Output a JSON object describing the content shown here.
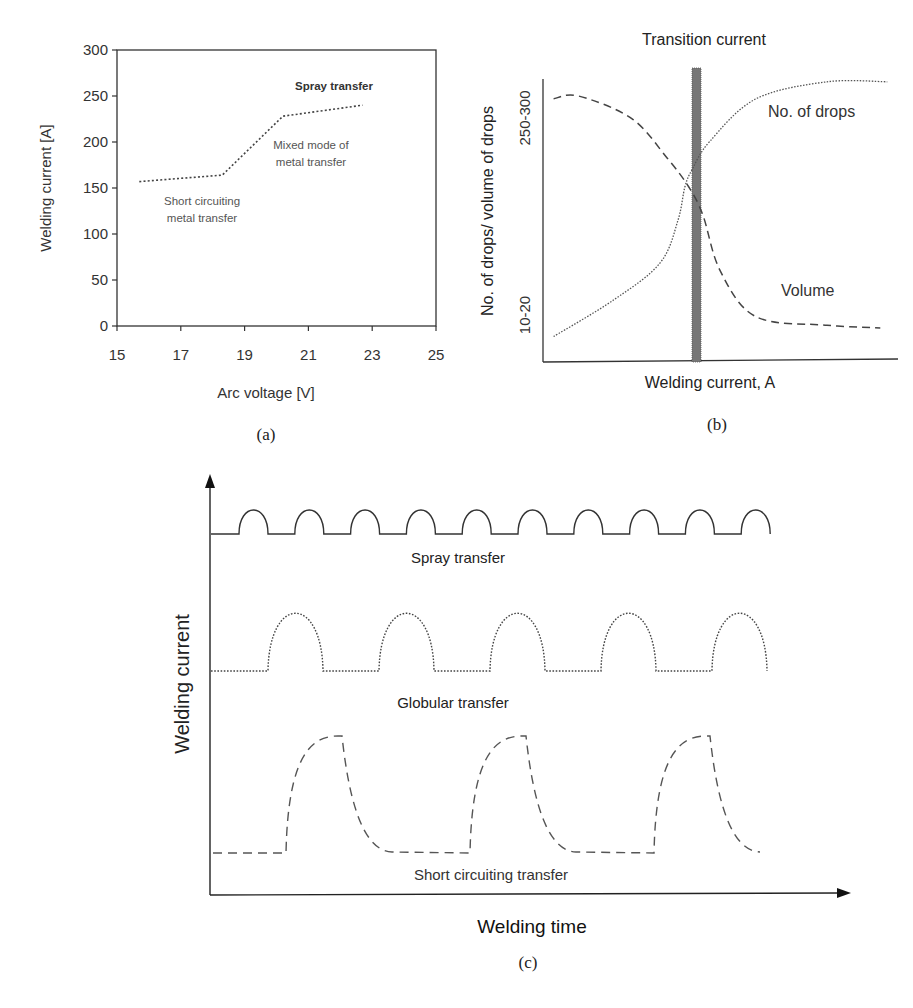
{
  "chart_data": [
    {
      "panel": "a",
      "type": "line",
      "caption": "(a)",
      "xlabel": "Arc voltage [V]",
      "ylabel": "Welding current [A]",
      "xlim": [
        15,
        25
      ],
      "ylim": [
        0,
        300
      ],
      "xticks": [
        15,
        17,
        19,
        21,
        23,
        25
      ],
      "yticks": [
        0,
        50,
        100,
        150,
        200,
        250,
        300
      ],
      "grid": false,
      "series": [
        {
          "name": "transfer mode boundary",
          "style": "dotted",
          "x": [
            15.7,
            18.3,
            20.2,
            22.7
          ],
          "y": [
            157,
            164,
            228,
            240
          ]
        }
      ],
      "annotations": [
        {
          "text": "Spray transfer",
          "x": 21.9,
          "y": 258,
          "bold": true
        },
        {
          "text": "Mixed mode of",
          "x": 21.1,
          "y": 204
        },
        {
          "text": "metal transfer",
          "x": 21.1,
          "y": 185
        },
        {
          "text": "Short circuiting",
          "x": 17.6,
          "y": 140
        },
        {
          "text": "metal transfer",
          "x": 17.6,
          "y": 121
        }
      ]
    },
    {
      "panel": "b",
      "type": "line",
      "caption": "(b)",
      "title": "Transition current",
      "xlabel": "Welding current, A",
      "ylabel": "No. of drops/ volume of drops",
      "ytick_labels": [
        "10-20",
        "250-300"
      ],
      "grid": false,
      "transition_marker": {
        "x_relative": 0.42,
        "label": "Transition current"
      },
      "series": [
        {
          "name": "No. of drops",
          "style": "dotted",
          "x": [
            0.03,
            0.2,
            0.33,
            0.38,
            0.4,
            0.42,
            0.47,
            0.6,
            0.8,
            0.97
          ],
          "y": [
            0.09,
            0.22,
            0.35,
            0.5,
            0.62,
            0.68,
            0.78,
            0.93,
            0.99,
            0.99
          ]
        },
        {
          "name": "Volume",
          "style": "dashed",
          "x": [
            0.03,
            0.1,
            0.25,
            0.35,
            0.41,
            0.45,
            0.5,
            0.6,
            0.8,
            0.95
          ],
          "y": [
            0.93,
            0.94,
            0.86,
            0.72,
            0.62,
            0.52,
            0.32,
            0.16,
            0.13,
            0.12
          ]
        }
      ],
      "legend": [
        {
          "text": "No. of drops"
        },
        {
          "text": "Volume"
        }
      ]
    },
    {
      "panel": "c",
      "type": "line",
      "caption": "(c)",
      "xlabel": "Welding time",
      "ylabel": "Welding current",
      "grid": false,
      "series": [
        {
          "name": "Spray transfer",
          "style": "solid",
          "cycles": 10,
          "pulse_shape": "half-ellipse"
        },
        {
          "name": "Globular transfer",
          "style": "dotted",
          "cycles": 5,
          "pulse_shape": "half-ellipse"
        },
        {
          "name": "Short circuiting transfer",
          "style": "dashed",
          "cycles": 3,
          "pulse_shape": "rise-then-exponential-decay"
        }
      ]
    }
  ],
  "labels": {
    "a": {
      "caption": "(a)",
      "xlabel": "Arc voltage [V]",
      "ylabel": "Welding current [A]",
      "xticks": [
        "15",
        "17",
        "19",
        "21",
        "23",
        "25"
      ],
      "yticks": [
        "0",
        "50",
        "100",
        "150",
        "200",
        "250",
        "300"
      ],
      "ann_spray": "Spray transfer",
      "ann_mixed_1": "Mixed mode of",
      "ann_mixed_2": "metal transfer",
      "ann_short_1": "Short circuiting",
      "ann_short_2": "metal transfer"
    },
    "b": {
      "caption": "(b)",
      "title": "Transition current",
      "xlabel": "Welding current, A",
      "ylabel": "No. of drops/ volume of drops",
      "ytick_high": "250-300",
      "ytick_low": "10-20",
      "legend_drops": "No. of drops",
      "legend_volume": "Volume"
    },
    "c": {
      "caption": "(c)",
      "xlabel": "Welding time",
      "ylabel": "Welding current",
      "spray": "Spray transfer",
      "globular": "Globular transfer",
      "short": "Short circuiting transfer"
    }
  },
  "colors": {
    "axis": "#333333",
    "line": "#444444",
    "text": "#333333",
    "annotation": "#555555",
    "transition_bar": "#777777"
  }
}
